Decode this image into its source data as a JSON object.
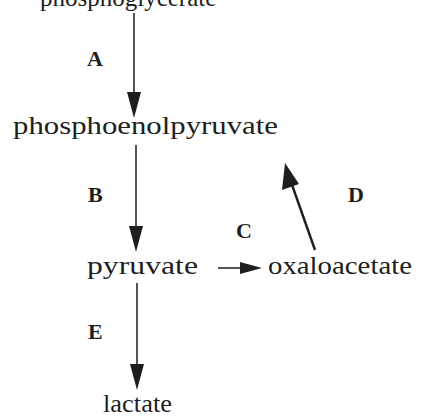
{
  "diagram": {
    "type": "metabolic-pathway",
    "nodes": [
      {
        "id": "top",
        "label": "phosphoglycerate",
        "note": "partially cropped at top edge"
      },
      {
        "id": "pep",
        "label": "phosphoenolpyruvate"
      },
      {
        "id": "pyruvate",
        "label": "pyruvate"
      },
      {
        "id": "oaa",
        "label": "oxaloacetate"
      },
      {
        "id": "lactate",
        "label": "lactate"
      }
    ],
    "steps": [
      {
        "label": "A",
        "from": "top",
        "to": "pep"
      },
      {
        "label": "B",
        "from": "pep",
        "to": "pyruvate"
      },
      {
        "label": "C",
        "from": "pyruvate",
        "to": "oaa"
      },
      {
        "label": "D",
        "from": "oaa",
        "to": "pep"
      },
      {
        "label": "E",
        "from": "pyruvate",
        "to": "lactate"
      }
    ],
    "colors": {
      "ink": "#1e1e1e",
      "background": "#ffffff"
    }
  }
}
